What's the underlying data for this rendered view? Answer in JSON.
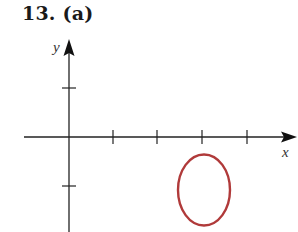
{
  "title": "13. (a)",
  "axes": {
    "x_label": "x",
    "y_label": "y",
    "axis_color": "#222222",
    "x_ticks": [
      1,
      2,
      3,
      4
    ],
    "y_ticks": [
      1,
      -1
    ]
  },
  "curve": {
    "shape": "ellipse",
    "color": "#b03a3a",
    "center": [
      3,
      -1.08
    ],
    "rx": 0.58,
    "ry": 0.73
  }
}
